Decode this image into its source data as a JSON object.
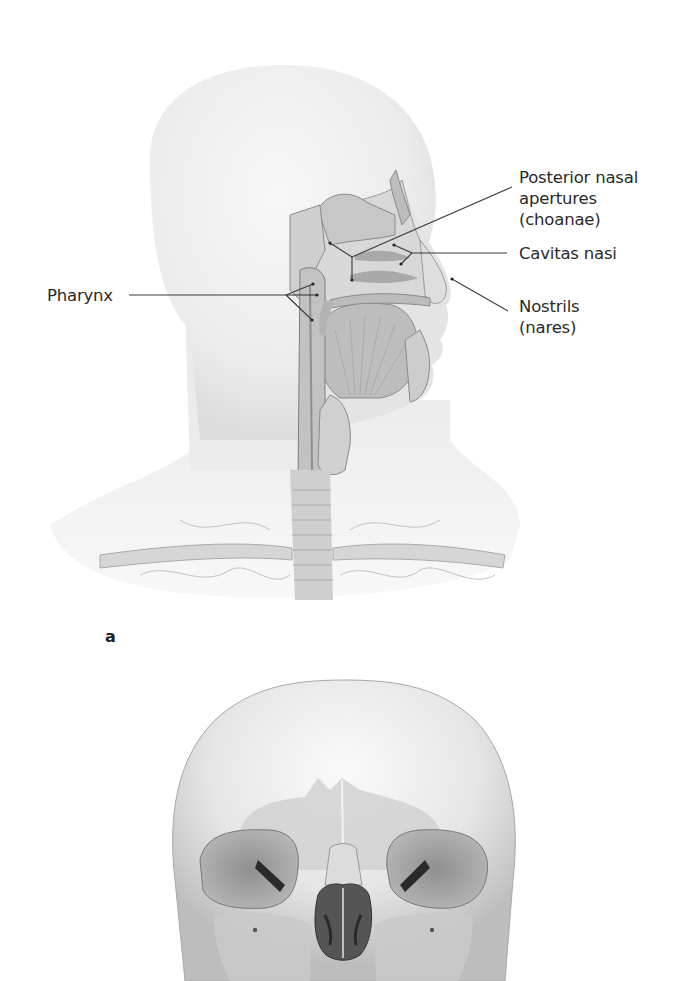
{
  "figure": {
    "panel_a": {
      "letter": "a",
      "labels": {
        "pharynx": "Pharynx",
        "posterior_nasal_line1": "Posterior nasal",
        "posterior_nasal_line2": "apertures",
        "posterior_nasal_line3": "(choanae)",
        "cavitas_nasi": "Cavitas nasi",
        "nostrils_line1": "Nostrils",
        "nostrils_line2": "(nares)"
      }
    },
    "panel_b": {
      "description": "Anterior view of skull"
    },
    "colors": {
      "leader_line": "#3a3a3a",
      "label_text": "#2a2a2a",
      "tissue_light": "#e8e8e8",
      "tissue_mid": "#c9c9c9",
      "tissue_dark": "#8a8a8a"
    }
  }
}
